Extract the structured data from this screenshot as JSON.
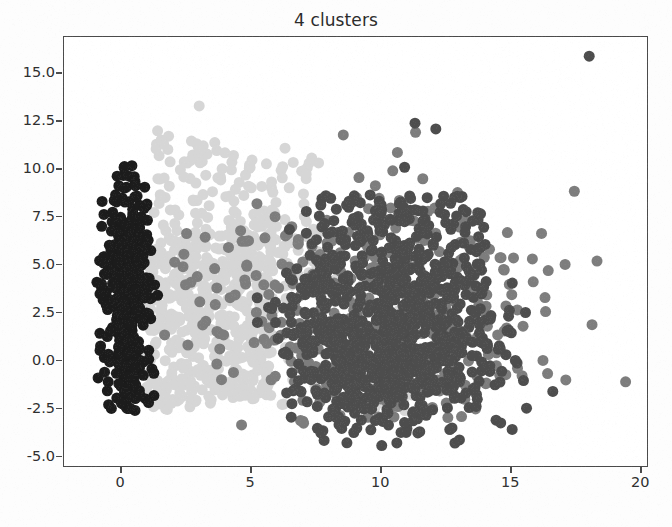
{
  "chart_data": {
    "type": "scatter",
    "title": "4 clusters",
    "xlabel": "",
    "ylabel": "",
    "xlim": [
      -2.2,
      20.3
    ],
    "ylim": [
      -5.6,
      16.9
    ],
    "xticks": [
      0,
      5,
      10,
      15,
      20
    ],
    "xtick_labels": [
      "0",
      "5",
      "10",
      "15",
      "20"
    ],
    "yticks": [
      -5.0,
      -2.5,
      0.0,
      2.5,
      5.0,
      7.5,
      10.0,
      12.5,
      15.0
    ],
    "ytick_labels": [
      "-5.0",
      "-2.5",
      "0.0",
      "2.5",
      "5.0",
      "7.5",
      "10.0",
      "12.5",
      "15.0"
    ],
    "grid": false,
    "legend": null,
    "legend_position": "none",
    "marker_size": 11,
    "n_clusters": 4,
    "series": [
      {
        "name": "cluster-1",
        "color": "#1c1c1c",
        "n_points": 430,
        "description": "near-vertical dense dark band at left edge",
        "x_center": 0.25,
        "y_center": 3.1,
        "x_spread": 0.75,
        "y_spread": 3.4,
        "x_range": [
          -1.4,
          1.7
        ],
        "y_range": [
          -2.6,
          10.2
        ]
      },
      {
        "name": "cluster-2",
        "color": "#d6d6d6",
        "n_points": 760,
        "description": "large light-gray wedge spanning mid-left, widening upward",
        "x_center": 4.2,
        "y_center": 2.2,
        "x_spread": 2.6,
        "y_spread": 3.0,
        "x_range": [
          0.4,
          11.5
        ],
        "y_range": [
          -3.1,
          13.3
        ]
      },
      {
        "name": "cluster-3",
        "color": "#4d4d4d",
        "n_points": 980,
        "description": "dense dark mass on right half centered near x=10",
        "x_center": 10.2,
        "y_center": 0.6,
        "x_spread": 2.3,
        "y_spread": 2.2,
        "x_range": [
          5.2,
          15.6
        ],
        "y_range": [
          -4.6,
          10.0
        ]
      },
      {
        "name": "cluster-4",
        "color": "#7d7d7d",
        "n_points": 360,
        "description": "medium-gray scattered halo over right region plus far outliers",
        "x_center": 10.6,
        "y_center": 2.9,
        "x_spread": 3.0,
        "y_spread": 3.4,
        "x_range": [
          1.6,
          19.4
        ],
        "y_range": [
          -3.6,
          16.0
        ]
      }
    ],
    "outliers": [
      {
        "x": 18.0,
        "y": 15.9,
        "color": "#4d4d4d"
      },
      {
        "x": 19.4,
        "y": -1.1,
        "color": "#7d7d7d"
      },
      {
        "x": 18.3,
        "y": 5.2,
        "color": "#7d7d7d"
      },
      {
        "x": 16.6,
        "y": -1.6,
        "color": "#4d4d4d"
      },
      {
        "x": 17.1,
        "y": -1.0,
        "color": "#7d7d7d"
      },
      {
        "x": 16.3,
        "y": 3.3,
        "color": "#7d7d7d"
      },
      {
        "x": 11.3,
        "y": 12.4,
        "color": "#4d4d4d"
      },
      {
        "x": 12.1,
        "y": 12.1,
        "color": "#4d4d4d"
      },
      {
        "x": 10.9,
        "y": 10.1,
        "color": "#4d4d4d"
      },
      {
        "x": 11.6,
        "y": 9.5,
        "color": "#7d7d7d"
      },
      {
        "x": 3.0,
        "y": 13.3,
        "color": "#d6d6d6"
      },
      {
        "x": 1.4,
        "y": 12.0,
        "color": "#d6d6d6"
      }
    ]
  },
  "figure": {
    "background_color": "#ffffff",
    "axis_color": "#4a4a4a",
    "tick_text_color": "#2e2e2e",
    "title_color": "#2b2b2b"
  }
}
